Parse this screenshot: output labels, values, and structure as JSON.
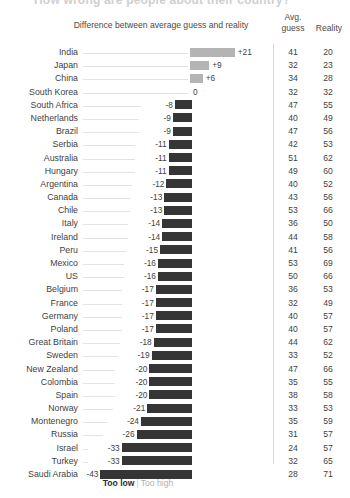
{
  "title": "How wrong are people about their country?",
  "header": {
    "diff_label": "Difference between average guess and reality",
    "avg_label": "Avg.",
    "guess_label": "guess",
    "reality_label": "Reality"
  },
  "legend": {
    "too_low": "Too low",
    "divider": "|",
    "too_high": "Too high"
  },
  "colors": {
    "negative_bar": "#353535",
    "positive_bar": "#b4b4b4",
    "leader_line": "#e2e2e2",
    "separator": "#d8d8d8",
    "text": "#3f3f3f",
    "legend_low": "#2e2e2e",
    "legend_high": "#b0b0b0"
  },
  "chart_data": {
    "type": "bar",
    "title": "How wrong are people about their country?",
    "xlabel": "Difference between average guess and reality",
    "ylabel": "",
    "orientation": "horizontal",
    "grid": false,
    "zero_line": true,
    "xlim": [
      -43,
      21
    ],
    "categories": [
      "India",
      "Japan",
      "China",
      "South Korea",
      "South Africa",
      "Netherlands",
      "Brazil",
      "Serbia",
      "Australia",
      "Hungary",
      "Argentina",
      "Canada",
      "Chile",
      "Italy",
      "Ireland",
      "Peru",
      "Mexico",
      "US",
      "Belgium",
      "France",
      "Germany",
      "Poland",
      "Great Britain",
      "Sweden",
      "New Zealand",
      "Colombia",
      "Spain",
      "Norway",
      "Montenegro",
      "Russia",
      "Israel",
      "Turkey",
      "Saudi Arabia"
    ],
    "values": [
      21,
      9,
      6,
      0,
      -8,
      -9,
      -9,
      -11,
      -11,
      -11,
      -12,
      -13,
      -13,
      -14,
      -14,
      -15,
      -16,
      -16,
      -17,
      -17,
      -17,
      -17,
      -18,
      -19,
      -20,
      -20,
      -20,
      -21,
      -24,
      -26,
      -33,
      -33,
      -43
    ],
    "series": [
      {
        "name": "Avg. guess",
        "values": [
          41,
          32,
          34,
          32,
          47,
          40,
          47,
          42,
          51,
          49,
          40,
          43,
          53,
          36,
          44,
          41,
          53,
          50,
          36,
          32,
          40,
          40,
          44,
          33,
          47,
          35,
          38,
          33,
          35,
          31,
          24,
          32,
          28
        ]
      },
      {
        "name": "Reality",
        "values": [
          20,
          23,
          28,
          32,
          55,
          49,
          56,
          53,
          62,
          60,
          52,
          56,
          66,
          50,
          58,
          56,
          69,
          66,
          53,
          49,
          57,
          57,
          62,
          52,
          66,
          55,
          58,
          53,
          59,
          57,
          57,
          65,
          71
        ]
      }
    ]
  },
  "rows": [
    {
      "country": "India",
      "diff": "+21",
      "value": 21,
      "guess": "41",
      "reality": "20"
    },
    {
      "country": "Japan",
      "diff": "+9",
      "value": 9,
      "guess": "32",
      "reality": "23"
    },
    {
      "country": "China",
      "diff": "+6",
      "value": 6,
      "guess": "34",
      "reality": "28"
    },
    {
      "country": "South Korea",
      "diff": "0",
      "value": 0,
      "guess": "32",
      "reality": "32"
    },
    {
      "country": "South Africa",
      "diff": "-8",
      "value": -8,
      "guess": "47",
      "reality": "55"
    },
    {
      "country": "Netherlands",
      "diff": "-9",
      "value": -9,
      "guess": "40",
      "reality": "49"
    },
    {
      "country": "Brazil",
      "diff": "-9",
      "value": -9,
      "guess": "47",
      "reality": "56"
    },
    {
      "country": "Serbia",
      "diff": "-11",
      "value": -11,
      "guess": "42",
      "reality": "53"
    },
    {
      "country": "Australia",
      "diff": "-11",
      "value": -11,
      "guess": "51",
      "reality": "62"
    },
    {
      "country": "Hungary",
      "diff": "-11",
      "value": -11,
      "guess": "49",
      "reality": "60"
    },
    {
      "country": "Argentina",
      "diff": "-12",
      "value": -12,
      "guess": "40",
      "reality": "52"
    },
    {
      "country": "Canada",
      "diff": "-13",
      "value": -13,
      "guess": "43",
      "reality": "56"
    },
    {
      "country": "Chile",
      "diff": "-13",
      "value": -13,
      "guess": "53",
      "reality": "66"
    },
    {
      "country": "Italy",
      "diff": "-14",
      "value": -14,
      "guess": "36",
      "reality": "50"
    },
    {
      "country": "Ireland",
      "diff": "-14",
      "value": -14,
      "guess": "44",
      "reality": "58"
    },
    {
      "country": "Peru",
      "diff": "-15",
      "value": -15,
      "guess": "41",
      "reality": "56"
    },
    {
      "country": "Mexico",
      "diff": "-16",
      "value": -16,
      "guess": "53",
      "reality": "69"
    },
    {
      "country": "US",
      "diff": "-16",
      "value": -16,
      "guess": "50",
      "reality": "66"
    },
    {
      "country": "Belgium",
      "diff": "-17",
      "value": -17,
      "guess": "36",
      "reality": "53"
    },
    {
      "country": "France",
      "diff": "-17",
      "value": -17,
      "guess": "32",
      "reality": "49"
    },
    {
      "country": "Germany",
      "diff": "-17",
      "value": -17,
      "guess": "40",
      "reality": "57"
    },
    {
      "country": "Poland",
      "diff": "-17",
      "value": -17,
      "guess": "40",
      "reality": "57"
    },
    {
      "country": "Great Britain",
      "diff": "-18",
      "value": -18,
      "guess": "44",
      "reality": "62"
    },
    {
      "country": "Sweden",
      "diff": "-19",
      "value": -19,
      "guess": "33",
      "reality": "52"
    },
    {
      "country": "New Zealand",
      "diff": "-20",
      "value": -20,
      "guess": "47",
      "reality": "66"
    },
    {
      "country": "Colombia",
      "diff": "-20",
      "value": -20,
      "guess": "35",
      "reality": "55"
    },
    {
      "country": "Spain",
      "diff": "-20",
      "value": -20,
      "guess": "38",
      "reality": "58"
    },
    {
      "country": "Norway",
      "diff": "-21",
      "value": -21,
      "guess": "33",
      "reality": "53"
    },
    {
      "country": "Montenegro",
      "diff": "-24",
      "value": -24,
      "guess": "35",
      "reality": "59"
    },
    {
      "country": "Russia",
      "diff": "-26",
      "value": -26,
      "guess": "31",
      "reality": "57"
    },
    {
      "country": "Israel",
      "diff": "-33",
      "value": -33,
      "guess": "24",
      "reality": "57"
    },
    {
      "country": "Turkey",
      "diff": "-33",
      "value": -33,
      "guess": "32",
      "reality": "65"
    },
    {
      "country": "Saudi Arabia",
      "diff": "-43",
      "value": -43,
      "guess": "28",
      "reality": "71"
    }
  ]
}
